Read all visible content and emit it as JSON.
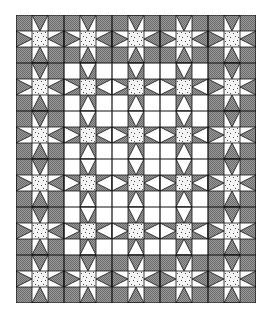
{
  "quilt": {
    "cols": 15,
    "rows": 18,
    "cell_px": 16,
    "block_size": 3,
    "interior_region": {
      "col_start": 3,
      "col_end": 11,
      "row_start": 3,
      "row_end": 14
    },
    "colors": {
      "dark": "#6b6b6b",
      "dark_alt": "#9a9a9a",
      "light": "#ffffff",
      "speckle_bg": "#f4f4f4",
      "speckle_dot": "#555555",
      "line": "#111111"
    },
    "legend": {
      "corner_outer": "dark checkered square",
      "corner_inner": "white square",
      "center": "speckled square",
      "edge_outer": "dark triangle on white (forms dark diamonds)",
      "edge_inner": "white triangle on dark (forms white diamonds)"
    }
  }
}
